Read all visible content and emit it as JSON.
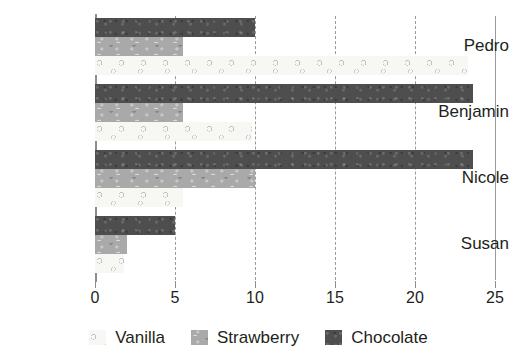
{
  "chart_data": {
    "type": "bar",
    "orientation": "horizontal",
    "title": "",
    "subtitle": "",
    "xlabel": "",
    "ylabel": "",
    "categories": [
      "Pedro",
      "Benjamin",
      "Nicole",
      "Susan"
    ],
    "series": [
      {
        "name": "Vanilla",
        "color": "#f7f7f4",
        "values": [
          23.3,
          9.8,
          5.5,
          1.8
        ]
      },
      {
        "name": "Strawberry",
        "color": "#a9a9a9",
        "values": [
          5.5,
          5.5,
          10.0,
          2.0
        ]
      },
      {
        "name": "Chocolate",
        "color": "#4e4e4e",
        "values": [
          10.0,
          23.6,
          23.6,
          5.0
        ]
      }
    ],
    "xlim": [
      0,
      25
    ],
    "xticks": [
      0,
      5,
      10,
      15,
      20,
      25
    ],
    "xtick_labels": [
      "0",
      "5",
      "10",
      "15",
      "20",
      "25"
    ],
    "grid": true,
    "grid_axis": "x",
    "grid_style": "dashed",
    "legend_position": "bottom",
    "series_draw_order_top_to_bottom": [
      "Chocolate",
      "Strawberry",
      "Vanilla"
    ]
  },
  "legend": {
    "items": [
      {
        "label": "Vanilla",
        "swatch": "vanilla-swatch"
      },
      {
        "label": "Strawberry",
        "swatch": "strawberry-swatch"
      },
      {
        "label": "Chocolate",
        "swatch": "chocolate-swatch"
      }
    ]
  },
  "axis": {
    "y_labels": [
      "Pedro",
      "Benjamin",
      "Nicole",
      "Susan"
    ],
    "x_labels": [
      "0",
      "5",
      "10",
      "15",
      "20",
      "25"
    ]
  }
}
